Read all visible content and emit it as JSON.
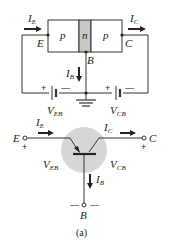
{
  "top_circuit": {
    "regions": [
      {
        "label": "p",
        "fill": "#ffffff"
      },
      {
        "label": "n",
        "fill": "#c8c8c8"
      },
      {
        "label": "p",
        "fill": "#ffffff"
      }
    ],
    "terminals": {
      "emitter": "E",
      "base": "B",
      "collector": "C"
    },
    "currents": {
      "emitter": {
        "main": "I",
        "sub": "E"
      },
      "collector": {
        "main": "I",
        "sub": "C"
      },
      "base": {
        "main": "I",
        "sub": "B"
      }
    },
    "sources": {
      "veb": {
        "main": "V",
        "sub": "EB",
        "plus": "+",
        "minus": "—"
      },
      "vcb": {
        "main": "V",
        "sub": "CB",
        "plus": "+",
        "minus": "—"
      }
    }
  },
  "bottom_symbol": {
    "terminals": {
      "emitter": "E",
      "collector": "C",
      "base": "B"
    },
    "currents": {
      "emitter": {
        "main": "I",
        "sub": "E"
      },
      "collector": {
        "main": "I",
        "sub": "C"
      },
      "base": {
        "main": "I",
        "sub": "B"
      }
    },
    "voltages": {
      "veb": {
        "main": "V",
        "sub": "EB"
      },
      "vcb": {
        "main": "V",
        "sub": "CB"
      }
    },
    "signs": {
      "emitter_plus": "+",
      "collector_plus": "+",
      "base_minus_left": "—",
      "base_minus_right": "—"
    },
    "highlight_color": "#d6d6d6"
  },
  "caption": "(a)"
}
